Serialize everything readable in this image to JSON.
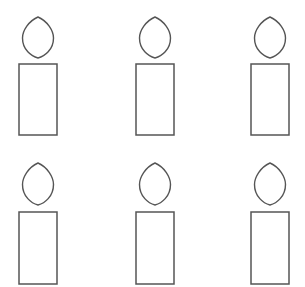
{
  "artwork": {
    "title": "Candle line drawings",
    "description": "Six identical outline candle figures arranged in a two-row by three-column grid on a plain white background.",
    "background_color": "#ffffff",
    "stroke_color": "#555555",
    "fill_color": "#ffffff",
    "canvas": {
      "width": 305,
      "height": 287
    },
    "grid": {
      "rows": 2,
      "columns": 3,
      "total_items": 6
    },
    "shape_names": {
      "flame": "flame-leaf-shape",
      "body": "candle-body-rectangle"
    },
    "geometry": {
      "column_centers": [
        38,
        155,
        270
      ],
      "body_width": 38,
      "flame_width": 31,
      "rows": [
        {
          "flame_top": 17,
          "flame_bottom": 58,
          "body_top": 64,
          "body_bottom": 135
        },
        {
          "flame_top": 163,
          "flame_bottom": 205,
          "body_top": 212,
          "body_bottom": 284
        }
      ]
    },
    "items": [
      {
        "id": "candle-1",
        "row": 1,
        "column": 1,
        "label": "Candle 1"
      },
      {
        "id": "candle-2",
        "row": 1,
        "column": 2,
        "label": "Candle 2"
      },
      {
        "id": "candle-3",
        "row": 1,
        "column": 3,
        "label": "Candle 3"
      },
      {
        "id": "candle-4",
        "row": 2,
        "column": 1,
        "label": "Candle 4"
      },
      {
        "id": "candle-5",
        "row": 2,
        "column": 2,
        "label": "Candle 5"
      },
      {
        "id": "candle-6",
        "row": 2,
        "column": 3,
        "label": "Candle 6"
      }
    ]
  }
}
